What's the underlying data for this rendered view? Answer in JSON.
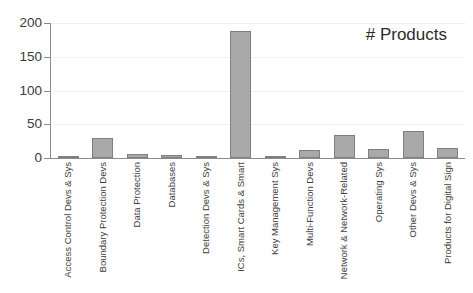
{
  "chart_data": {
    "type": "bar",
    "title": "# Products",
    "xlabel": "",
    "ylabel": "",
    "ylim": [
      0,
      200
    ],
    "yticks": [
      0,
      50,
      100,
      150,
      200
    ],
    "grid": true,
    "legend": false,
    "bar_color": "#a9a9a9",
    "bar_edge_color": "#7f7f7f",
    "categories": [
      "Access Control Devs & Sys",
      "Boundary Protection Devs",
      "Data Protection",
      "Databases",
      "Detection Devs & Sys",
      "ICs, Smart Cards & Smart",
      "Key Management Sys",
      "Multi-Function Devs",
      "Network & Network-Related",
      "Operating Sys",
      "Other Devs & Sys",
      "Products for Digital Sign"
    ],
    "values": [
      3,
      30,
      6,
      4,
      1,
      188,
      3,
      12,
      34,
      13,
      40,
      15
    ]
  }
}
